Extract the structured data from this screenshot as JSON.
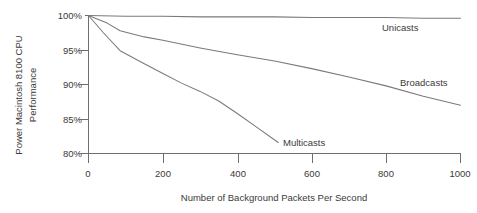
{
  "chart_data": {
    "type": "line",
    "title": "",
    "xlabel": "Number of Background Packets Per Second",
    "ylabel": "Power Macintosh 8100 CPU Performance",
    "ylabel_line1": "Power Macintosh 8100 CPU",
    "ylabel_line2": "Performance",
    "xlim": [
      0,
      1000
    ],
    "ylim": [
      80,
      100
    ],
    "xticks": [
      0,
      200,
      400,
      600,
      800,
      1000
    ],
    "xtick_labels": [
      "0",
      "200",
      "400",
      "600",
      "800",
      "1000"
    ],
    "yticks": [
      80,
      85,
      90,
      95,
      100
    ],
    "ytick_labels": [
      "80%",
      "85%",
      "90%",
      "95%",
      "100%"
    ],
    "grid": false,
    "legend_position": "inline-annotations",
    "line_color": "#7a7a7a",
    "axis_color": "#6e6e6e",
    "series": [
      {
        "name": "Unicasts",
        "label": "Unicasts",
        "label_x": 740,
        "label_y": 99.6,
        "x": [
          0,
          100,
          200,
          300,
          400,
          500,
          600,
          700,
          800,
          900,
          1000
        ],
        "values": [
          100,
          99.9,
          99.9,
          99.8,
          99.8,
          99.8,
          99.7,
          99.7,
          99.7,
          99.6,
          99.6
        ]
      },
      {
        "name": "Broadcasts",
        "label": "Broadcasts",
        "label_x": 855,
        "label_y": 90.2,
        "x": [
          0,
          50,
          85,
          150,
          200,
          300,
          400,
          500,
          600,
          700,
          800,
          900,
          1000
        ],
        "values": [
          100,
          98.9,
          97.8,
          96.9,
          96.4,
          95.3,
          94.3,
          93.4,
          92.3,
          91.1,
          89.8,
          88.3,
          87.0
        ]
      },
      {
        "name": "Multicasts",
        "label": "Multicasts",
        "label_x": 545,
        "label_y": 81.6,
        "x": [
          0,
          40,
          85,
          150,
          200,
          250,
          300,
          350,
          400,
          450,
          510
        ],
        "values": [
          100,
          97.5,
          94.9,
          93.0,
          91.6,
          90.2,
          89.0,
          87.6,
          85.8,
          83.9,
          81.6
        ]
      }
    ]
  }
}
